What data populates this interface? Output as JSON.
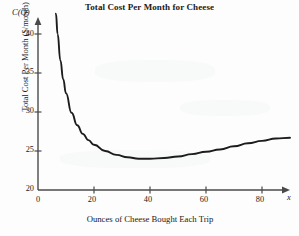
{
  "figure": {
    "title": "Total Cost Per Month for Cheese",
    "xlabel": "Ounces of Cheese Bought Each Trip",
    "ylabel": "Total Cost Per Month ($/month)",
    "y_axis_variable": "C(Q)",
    "x_axis_variable": "x",
    "curve_color": "#1c1c1c",
    "axis_color": "#4a4a4a",
    "background_color": "#fdfdfd"
  },
  "ticks": {
    "y": [
      "20",
      "25",
      "30",
      "35",
      "40"
    ],
    "x": [
      "0",
      "20",
      "40",
      "60",
      "80"
    ]
  },
  "chart_data": {
    "type": "line",
    "title": "Total Cost Per Month for Cheese",
    "xlabel": "Ounces of Cheese Bought Each Trip",
    "ylabel": "Total Cost Per Month ($/month)",
    "x_axis_variable": "x",
    "y_axis_variable": "C(Q)",
    "xlim": [
      0,
      92
    ],
    "ylim": [
      20,
      43
    ],
    "xticks": [
      0,
      20,
      40,
      60,
      80
    ],
    "yticks": [
      20,
      25,
      30,
      35,
      40
    ],
    "grid": false,
    "legend": "none",
    "minimum": {
      "x": 40,
      "y": 24.0
    },
    "series": [
      {
        "name": "C(Q)",
        "x": [
          6.4,
          7,
          8,
          9,
          10,
          12,
          14,
          16,
          18,
          20,
          24,
          28,
          32,
          36,
          40,
          45,
          50,
          55,
          60,
          65,
          70,
          75,
          80,
          85,
          90
        ],
        "y": [
          42.6,
          40.0,
          36.6,
          34.2,
          32.4,
          29.9,
          28.3,
          27.2,
          26.4,
          25.8,
          25.0,
          24.5,
          24.2,
          24.0,
          24.0,
          24.1,
          24.3,
          24.6,
          24.9,
          25.2,
          25.6,
          26.0,
          26.3,
          26.6,
          26.7
        ]
      }
    ]
  }
}
